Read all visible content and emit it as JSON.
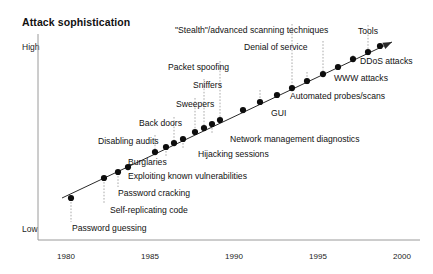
{
  "chart_title": "Attack sophistication",
  "axes": {
    "y_high_label": "High",
    "y_low_label": "Low",
    "x_ticks": [
      "1980",
      "1985",
      "1990",
      "1995",
      "2000"
    ]
  },
  "tools_label": "Tools",
  "chart_data": {
    "type": "scatter",
    "title": "Attack sophistication",
    "xlabel": "",
    "ylabel": "Attack sophistication",
    "xlim": [
      1978.5,
      2002
    ],
    "ylim": [
      0,
      1
    ],
    "grid": false,
    "legend": null,
    "annotations": [
      "Tools"
    ],
    "axis_tick_labels": {
      "x": [
        "1980",
        "1985",
        "1990",
        "1995",
        "2000"
      ],
      "y": [
        "Low",
        "High"
      ]
    },
    "points": [
      {
        "label": "Password guessing",
        "x": 1981.5,
        "y": 0.1
      },
      {
        "label": "Self-replicating code",
        "x": 1983.9,
        "y": 0.24
      },
      {
        "label": "Password cracking",
        "x": 1984.9,
        "y": 0.28
      },
      {
        "label": "Exploiting known vulnerabilities",
        "x": 1985.6,
        "y": 0.32
      },
      {
        "label": "Disabling audits",
        "x": 1987.6,
        "y": 0.43
      },
      {
        "label": "Burglaries",
        "x": 1988.4,
        "y": 0.47
      },
      {
        "label": "Back doors",
        "x": 1989.0,
        "y": 0.5
      },
      {
        "label": "Hijacking sessions",
        "x": 1989.7,
        "y": 0.54
      },
      {
        "label": "Sweepers",
        "x": 1990.6,
        "y": 0.59
      },
      {
        "label": "Sniffers",
        "x": 1991.3,
        "y": 0.63
      },
      {
        "label": "Network management diagnostics",
        "x": 1991.9,
        "y": 0.66
      },
      {
        "label": "Packet spoofing",
        "x": 1992.5,
        "y": 0.69
      },
      {
        "label": "GUI",
        "x": 1994.2,
        "y": 0.76
      },
      {
        "label": "Automated probes/scans",
        "x": 1995.5,
        "y": 0.81
      },
      {
        "label": "\"Stealth\"/advanced scanning techniques",
        "x": 1996.8,
        "y": 0.85
      },
      {
        "label": "WWW attacks",
        "x": 1997.9,
        "y": 0.89
      },
      {
        "label": "Denial of service",
        "x": 1999.0,
        "y": 0.92
      },
      {
        "label": "DDoS attacks",
        "x": 2000.2,
        "y": 0.95
      }
    ]
  },
  "labels": [
    {
      "text": "\"Stealth\"/advanced scanning techniques",
      "x": 175,
      "y": 26,
      "align": "right"
    },
    {
      "text": "Tools",
      "x": 358,
      "y": 27,
      "align": "right"
    },
    {
      "text": "Denial of service",
      "x": 244,
      "y": 43,
      "align": "right"
    },
    {
      "text": "DDoS attacks",
      "x": 360,
      "y": 57,
      "align": "right"
    },
    {
      "text": "Packet spoofing",
      "x": 168,
      "y": 63,
      "align": "right"
    },
    {
      "text": "WWW attacks",
      "x": 334,
      "y": 74,
      "align": "right"
    },
    {
      "text": "Sniffers",
      "x": 193,
      "y": 81,
      "align": "right"
    },
    {
      "text": "Automated probes/scans",
      "x": 290,
      "y": 92,
      "align": "right"
    },
    {
      "text": "Sweepers",
      "x": 176,
      "y": 100,
      "align": "right"
    },
    {
      "text": "GUI",
      "x": 271,
      "y": 109,
      "align": "right"
    },
    {
      "text": "Back doors",
      "x": 139,
      "y": 119,
      "align": "right"
    },
    {
      "text": "Network management diagnostics",
      "x": 230,
      "y": 135,
      "align": "right"
    },
    {
      "text": "Disabling audits",
      "x": 98,
      "y": 137,
      "align": "right"
    },
    {
      "text": "Hijacking sessions",
      "x": 198,
      "y": 150,
      "align": "right"
    },
    {
      "text": "Burglaries",
      "x": 128,
      "y": 158,
      "align": "right"
    },
    {
      "text": "Exploiting known vulnerabilities",
      "x": 128,
      "y": 172,
      "align": "right"
    },
    {
      "text": "Password cracking",
      "x": 118,
      "y": 189,
      "align": "right"
    },
    {
      "text": "Self-replicating code",
      "x": 110,
      "y": 206,
      "align": "right"
    },
    {
      "text": "Password guessing",
      "x": 72,
      "y": 224,
      "align": "right"
    }
  ],
  "geometry": {
    "axis_color": "#9a9a9a",
    "line_color": "#2a2a2a",
    "dot_color": "#0d0d0d",
    "leader_color": "#aaaaaa",
    "plot_left": 38,
    "plot_right": 420,
    "plot_top": 34,
    "plot_bottom": 240,
    "x_tick_px": [
      66,
      150,
      234,
      318,
      402
    ],
    "trend_start": [
      62,
      198
    ],
    "trend_end": [
      392,
      42
    ],
    "dots": [
      [
        71,
        198
      ],
      [
        104,
        178
      ],
      [
        118,
        172
      ],
      [
        128,
        167
      ],
      [
        155,
        152
      ],
      [
        166,
        147
      ],
      [
        174,
        143
      ],
      [
        183,
        139
      ],
      [
        195,
        132
      ],
      [
        204,
        128
      ],
      [
        212,
        124
      ],
      [
        220,
        120
      ],
      [
        243,
        110
      ],
      [
        260,
        102
      ],
      [
        277,
        95
      ],
      [
        292,
        88
      ],
      [
        307,
        81
      ],
      [
        323,
        74
      ],
      [
        338,
        67
      ],
      [
        353,
        59
      ],
      [
        368,
        52
      ],
      [
        380,
        46
      ]
    ],
    "leaders": [
      {
        "x": 71,
        "y1": 202,
        "y2": 222
      },
      {
        "x": 104,
        "y1": 182,
        "y2": 204
      },
      {
        "x": 118,
        "y1": 176,
        "y2": 187
      },
      {
        "x": 128,
        "y1": 171,
        "y2": 170
      },
      {
        "x": 155,
        "y1": 156,
        "y2": 135
      },
      {
        "x": 166,
        "y1": 151,
        "y2": 156
      },
      {
        "x": 174,
        "y1": 147,
        "y2": 117
      },
      {
        "x": 183,
        "y1": 143,
        "y2": 148
      },
      {
        "x": 195,
        "y1": 136,
        "y2": 98
      },
      {
        "x": 204,
        "y1": 132,
        "y2": 79
      },
      {
        "x": 212,
        "y1": 128,
        "y2": 133
      },
      {
        "x": 220,
        "y1": 124,
        "y2": 61
      },
      {
        "x": 243,
        "y1": 114,
        "y2": 107
      },
      {
        "x": 260,
        "y1": 106,
        "y2": 90
      },
      {
        "x": 292,
        "y1": 92,
        "y2": 24
      },
      {
        "x": 307,
        "y1": 85,
        "y2": 72
      },
      {
        "x": 323,
        "y1": 78,
        "y2": 41
      },
      {
        "x": 353,
        "y1": 63,
        "y2": 55
      },
      {
        "x": 368,
        "y1": 56,
        "y2": 25
      }
    ]
  }
}
